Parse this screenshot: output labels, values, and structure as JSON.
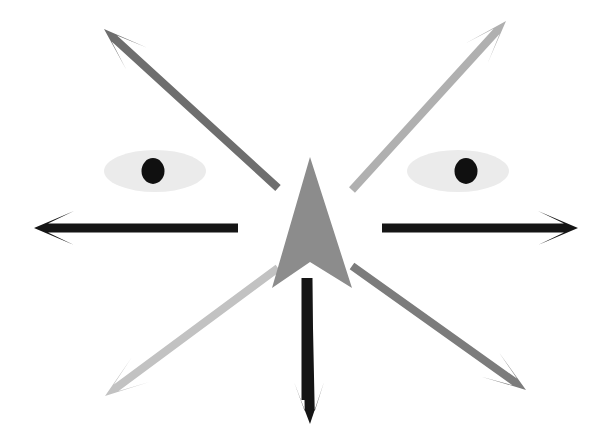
{
  "figure": {
    "width": 608,
    "height": 436,
    "background_color": "#FFFFFF",
    "description": "Eight arrows radiating outward from a central point, with a pair of stylized eyes above the horizontal axis."
  },
  "palette": {
    "background": "#FFFFFF",
    "black": "#151515",
    "center_arrowhead_gray": "#8C8C8C",
    "upper_left_gray": "#6E6E6E",
    "upper_right_gray": "#B0B0B0",
    "lower_left_gray": "#C2C2C2",
    "lower_right_gray": "#7C7C7C",
    "eye_sclera": "#EBEBEB",
    "eye_pupil": "#101010"
  },
  "center": {
    "name": "center-arrow",
    "head_color": "#8C8C8C",
    "shaft_color": "#151515",
    "tip_x": 310,
    "tip_y": 157,
    "base_left_x": 272,
    "base_right_x": 352,
    "base_y": 288,
    "notch_y": 262,
    "shaft_top_y": 278,
    "shaft_bottom_y": 400,
    "shaft_x": 307,
    "shaft_width": 11,
    "direction": "up",
    "shaft_direction": "down",
    "label": "central double arrow"
  },
  "eyes": [
    {
      "name": "left-eye",
      "side": "left",
      "center_x": 155,
      "center_y": 171,
      "radius_x": 51,
      "radius_y": 21,
      "sclera_color": "#EBEBEB",
      "pupil_x": 153,
      "pupil_y": 171,
      "pupil_radius": 11.5,
      "pupil_color": "#101010",
      "label": "left eye"
    },
    {
      "name": "right-eye",
      "side": "right",
      "center_x": 458,
      "center_y": 171,
      "radius_x": 51,
      "radius_y": 21,
      "sclera_color": "#EBEBEB",
      "pupil_x": 466,
      "pupil_y": 171,
      "pupil_radius": 11.5,
      "pupil_color": "#101010",
      "label": "right eye"
    }
  ],
  "arrows": [
    {
      "name": "arrow-west",
      "label": "left horizontal arrow",
      "direction": "west",
      "color": "#151515",
      "tail_x": 238,
      "tail_y": 228,
      "tip_x": 34,
      "tip_y": 228,
      "shaft_width": 9,
      "head_length": 40,
      "head_half_width": 17,
      "head_notch": 14
    },
    {
      "name": "arrow-east",
      "label": "right horizontal arrow",
      "direction": "east",
      "color": "#151515",
      "tail_x": 382,
      "tail_y": 228,
      "tip_x": 578,
      "tip_y": 228,
      "shaft_width": 9,
      "head_length": 40,
      "head_half_width": 17,
      "head_notch": 14
    },
    {
      "name": "arrow-south",
      "label": "bottom vertical arrow",
      "direction": "south",
      "color": "#151515",
      "tail_x": 307,
      "tail_y": 280,
      "tip_x": 310,
      "tip_y": 424,
      "shaft_width": 10,
      "head_length": 42,
      "head_half_width": 15,
      "head_notch": 13
    },
    {
      "name": "arrow-northwest",
      "label": "upper left diagonal arrow",
      "direction": "northwest",
      "color": "#6E6E6E",
      "tail_x": 278,
      "tail_y": 188,
      "tip_x": 104,
      "tip_y": 29,
      "shaft_width": 8,
      "head_length": 44,
      "head_half_width": 15,
      "head_notch": 14
    },
    {
      "name": "arrow-northeast",
      "label": "upper right diagonal arrow",
      "direction": "northeast",
      "color": "#B0B0B0",
      "tail_x": 352,
      "tail_y": 190,
      "tip_x": 506,
      "tip_y": 21,
      "shaft_width": 8,
      "head_length": 44,
      "head_half_width": 15,
      "head_notch": 14
    },
    {
      "name": "arrow-southwest",
      "label": "lower left diagonal arrow",
      "direction": "southwest",
      "color": "#C2C2C2",
      "tail_x": 278,
      "tail_y": 268,
      "tip_x": 105,
      "tip_y": 396,
      "shaft_width": 8,
      "head_length": 44,
      "head_half_width": 15,
      "head_notch": 14
    },
    {
      "name": "arrow-southeast",
      "label": "lower right diagonal arrow",
      "direction": "southeast",
      "color": "#7C7C7C",
      "tail_x": 352,
      "tail_y": 266,
      "tip_x": 526,
      "tip_y": 390,
      "shaft_width": 8,
      "head_length": 44,
      "head_half_width": 15,
      "head_notch": 14
    }
  ]
}
